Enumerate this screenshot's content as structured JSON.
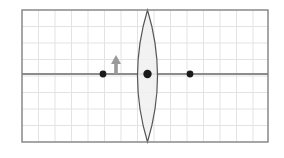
{
  "figure": {
    "type": "optics-ray-diagram",
    "canvas": {
      "width": 284,
      "height": 158,
      "background": "#ffffff"
    }
  },
  "frame": {
    "x": 22,
    "y": 10,
    "width": 246,
    "height": 132,
    "stroke": "#808080",
    "stroke_width": 1.4,
    "fill": "#ffffff"
  },
  "grid": {
    "visible": true,
    "cell_size": 16.5,
    "columns": 15,
    "rows": 8,
    "color": "#e3e3e3",
    "stroke_width": 1
  },
  "optical_axis": {
    "label": "principal axis",
    "x1": 22,
    "x2": 268,
    "y": 74,
    "color": "#8c8c8c",
    "stroke_width": 2
  },
  "lens": {
    "label": "converging lens",
    "shape": "biconvex",
    "center_x": 147.5,
    "top_y": 10,
    "bottom_y": 142,
    "half_width": 10,
    "outline_color": "#555555",
    "outline_width": 1.2,
    "fill_color": "#f0f0f0",
    "fill_opacity": 0.85
  },
  "points": [
    {
      "name": "object-base-point",
      "label": "object base",
      "x": 103,
      "y": 74,
      "radius": 3.4,
      "color": "#1a1a1a"
    },
    {
      "name": "lens-center-point",
      "label": "optical centre",
      "x": 147.5,
      "y": 74,
      "radius": 4.2,
      "color": "#1a1a1a"
    },
    {
      "name": "focal-point-right",
      "label": "focal point F",
      "x": 190,
      "y": 74,
      "radius": 3.4,
      "color": "#1a1a1a"
    }
  ],
  "object_arrow": {
    "label": "object",
    "x": 116,
    "base_y": 74,
    "tip_y": 55,
    "shaft_width": 3.6,
    "head_width": 10,
    "head_height": 9,
    "color": "#9a9a9a"
  }
}
